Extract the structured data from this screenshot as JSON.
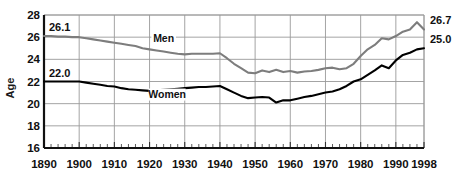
{
  "chart_data": {
    "type": "line",
    "title": "",
    "subtitle": "",
    "xlabel": "",
    "ylabel": "Age",
    "xlim": [
      1890,
      1998
    ],
    "ylim": [
      16,
      28
    ],
    "grid": true,
    "legend_position": "inline-annotations",
    "yticks": [
      16,
      18,
      20,
      22,
      24,
      26,
      28
    ],
    "xticks": [
      1890,
      1900,
      1910,
      1920,
      1930,
      1940,
      1950,
      1960,
      1970,
      1980,
      1990,
      1998
    ],
    "x_minor_tick_step": 2,
    "annotations": [
      {
        "name": "men-start-value",
        "text": "26.1",
        "x": 1890,
        "y": 26.1,
        "side": "left"
      },
      {
        "name": "women-start-value",
        "text": "22.0",
        "x": 1890,
        "y": 22.0,
        "side": "left"
      },
      {
        "name": "men-end-value",
        "text": "26.7",
        "x": 1998,
        "y": 26.7,
        "side": "right"
      },
      {
        "name": "women-end-value",
        "text": "25.0",
        "x": 1998,
        "y": 25.0,
        "side": "right"
      }
    ],
    "series": [
      {
        "name": "Men",
        "label": "Men",
        "color": "#7d7d7d",
        "label_x": 1924,
        "label_y": 25.55,
        "x": [
          1890,
          1892,
          1894,
          1896,
          1898,
          1900,
          1902,
          1904,
          1906,
          1908,
          1910,
          1912,
          1914,
          1916,
          1918,
          1920,
          1922,
          1924,
          1926,
          1928,
          1930,
          1932,
          1934,
          1936,
          1938,
          1940,
          1942,
          1944,
          1946,
          1948,
          1950,
          1952,
          1954,
          1956,
          1958,
          1960,
          1962,
          1964,
          1966,
          1968,
          1970,
          1972,
          1974,
          1976,
          1978,
          1980,
          1982,
          1984,
          1986,
          1988,
          1990,
          1992,
          1994,
          1996,
          1998
        ],
        "y": [
          26.1,
          26.1,
          26.05,
          26.05,
          26.0,
          26.0,
          25.9,
          25.8,
          25.7,
          25.6,
          25.5,
          25.4,
          25.3,
          25.2,
          25.0,
          24.9,
          24.8,
          24.7,
          24.6,
          24.5,
          24.45,
          24.5,
          24.5,
          24.5,
          24.5,
          24.55,
          24.1,
          23.6,
          23.2,
          22.8,
          22.75,
          23.0,
          22.85,
          23.05,
          22.85,
          22.95,
          22.8,
          22.9,
          22.95,
          23.05,
          23.2,
          23.25,
          23.1,
          23.2,
          23.6,
          24.3,
          24.9,
          25.3,
          25.9,
          25.8,
          26.1,
          26.5,
          26.7,
          27.35,
          26.7
        ]
      },
      {
        "name": "Women",
        "label": "Women",
        "color": "#000000",
        "label_x": 1925,
        "label_y": 20.55,
        "x": [
          1890,
          1892,
          1894,
          1896,
          1898,
          1900,
          1902,
          1904,
          1906,
          1908,
          1910,
          1912,
          1914,
          1916,
          1918,
          1920,
          1922,
          1924,
          1926,
          1928,
          1930,
          1932,
          1934,
          1936,
          1938,
          1940,
          1942,
          1944,
          1946,
          1948,
          1950,
          1952,
          1954,
          1956,
          1958,
          1960,
          1962,
          1964,
          1966,
          1968,
          1970,
          1972,
          1974,
          1976,
          1978,
          1980,
          1982,
          1984,
          1986,
          1988,
          1990,
          1992,
          1994,
          1996,
          1998
        ],
        "y": [
          22.0,
          22.0,
          22.0,
          22.0,
          22.0,
          22.0,
          21.9,
          21.8,
          21.7,
          21.6,
          21.55,
          21.4,
          21.3,
          21.25,
          21.2,
          21.15,
          21.2,
          21.25,
          21.3,
          21.35,
          21.4,
          21.45,
          21.5,
          21.5,
          21.55,
          21.6,
          21.3,
          21.0,
          20.7,
          20.5,
          20.55,
          20.6,
          20.55,
          20.1,
          20.3,
          20.3,
          20.45,
          20.6,
          20.7,
          20.85,
          21.0,
          21.1,
          21.3,
          21.6,
          22.0,
          22.2,
          22.6,
          23.0,
          23.45,
          23.2,
          23.9,
          24.4,
          24.6,
          24.9,
          25.0
        ]
      }
    ]
  }
}
